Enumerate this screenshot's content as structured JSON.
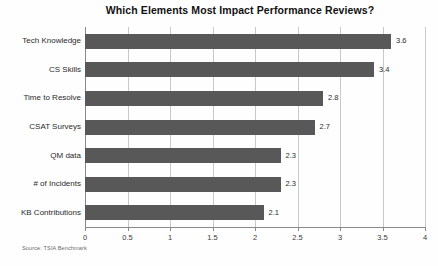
{
  "chart_data": {
    "type": "bar",
    "orientation": "horizontal",
    "title": "Which Elements Most Impact Performance Reviews?",
    "xlabel": "",
    "ylabel": "",
    "xlim": [
      0,
      4
    ],
    "grid": true,
    "legend": null,
    "source_note": "Source: TSIA Benchmark",
    "bar_color": "#585858",
    "gridline_color": "#c9c9c9",
    "axis_color": "#8a8a8a",
    "background_color": "#fefefe",
    "categories": [
      "Tech Knowledge",
      "CS Skills",
      "Time to Resolve",
      "CSAT Surveys",
      "QM data",
      "# of Incidents",
      "KB Contributions"
    ],
    "values": [
      3.6,
      3.4,
      2.8,
      2.7,
      2.3,
      2.3,
      2.1
    ],
    "value_labels": [
      "3.6",
      "3.4",
      "2.8",
      "2.7",
      "2.3",
      "2.3",
      "2.1"
    ],
    "xticks": [
      0,
      0.5,
      1,
      1.5,
      2,
      2.5,
      3,
      3.5,
      4
    ],
    "xtick_labels": [
      "0",
      "0.5",
      "1",
      "1.5",
      "2",
      "2.5",
      "3",
      "3.5",
      "4"
    ]
  }
}
